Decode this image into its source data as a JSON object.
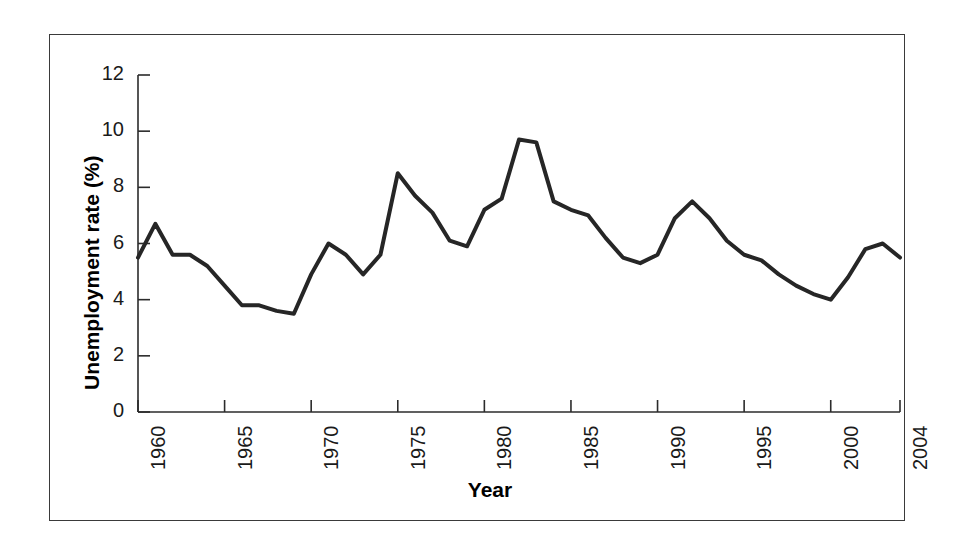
{
  "figure": {
    "border_color": "#3a3a3a",
    "background": "#ffffff"
  },
  "chart_data": {
    "type": "line",
    "title": "",
    "xlabel": "Year",
    "ylabel": "Unemployment rate (%)",
    "xlim": [
      1960,
      2004
    ],
    "ylim": [
      0,
      12
    ],
    "grid": false,
    "legend": null,
    "line_color": "#262626",
    "line_width": 4,
    "xticks": [
      1960,
      1965,
      1970,
      1975,
      1980,
      1985,
      1990,
      1995,
      2000,
      2004
    ],
    "xtick_labels": [
      "1960",
      "1965",
      "1970",
      "1975",
      "1980",
      "1985",
      "1990",
      "1995",
      "2000",
      "2004"
    ],
    "xtick_minor": [
      1961,
      1962,
      1963,
      1964,
      1966,
      1967,
      1968,
      1969,
      1971,
      1972,
      1973,
      1974,
      1976,
      1977,
      1978,
      1979,
      1981,
      1982,
      1983,
      1984,
      1986,
      1987,
      1988,
      1989,
      1991,
      1992,
      1993,
      1994,
      1996,
      1997,
      1998,
      1999,
      2001,
      2002,
      2003
    ],
    "yticks": [
      0,
      2,
      4,
      6,
      8,
      10,
      12
    ],
    "ytick_labels": [
      "0",
      "2",
      "4",
      "6",
      "8",
      "10",
      "12"
    ],
    "x": [
      1960,
      1961,
      1962,
      1963,
      1964,
      1965,
      1966,
      1967,
      1968,
      1969,
      1970,
      1971,
      1972,
      1973,
      1974,
      1975,
      1976,
      1977,
      1978,
      1979,
      1980,
      1981,
      1982,
      1983,
      1984,
      1985,
      1986,
      1987,
      1988,
      1989,
      1990,
      1991,
      1992,
      1993,
      1994,
      1995,
      1996,
      1997,
      1998,
      1999,
      2000,
      2001,
      2002,
      2003,
      2004
    ],
    "values": [
      5.5,
      6.7,
      5.6,
      5.6,
      5.2,
      4.5,
      3.8,
      3.8,
      3.6,
      3.5,
      4.9,
      6.0,
      5.6,
      4.9,
      5.6,
      8.5,
      7.7,
      7.1,
      6.1,
      5.9,
      7.2,
      7.6,
      9.7,
      9.6,
      7.5,
      7.2,
      7.0,
      6.2,
      5.5,
      5.3,
      5.6,
      6.9,
      7.5,
      6.9,
      6.1,
      5.6,
      5.4,
      4.9,
      4.5,
      4.2,
      4.0,
      4.8,
      5.8,
      6.0,
      5.5
    ],
    "series_name": "Unemployment rate"
  }
}
